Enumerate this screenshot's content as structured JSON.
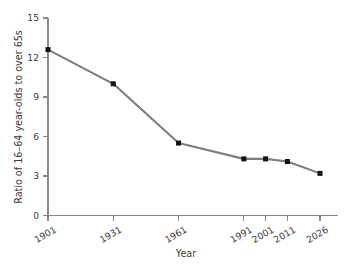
{
  "chart_data": {
    "type": "line",
    "title": "",
    "xlabel": "Year",
    "ylabel": "Ratio of 16–64 year-olds to over 65s",
    "categories": [
      "1901",
      "1931",
      "1961",
      "1991",
      "2001",
      "2011",
      "2026"
    ],
    "x": [
      1901,
      1931,
      1961,
      1991,
      2001,
      2011,
      2026
    ],
    "values": [
      12.6,
      10.0,
      5.5,
      4.3,
      4.3,
      4.1,
      3.2
    ],
    "series": [
      {
        "name": "Ratio of 16–64 year-olds to over 65s",
        "values": [
          12.6,
          10.0,
          5.5,
          4.3,
          4.3,
          4.1,
          3.2
        ]
      }
    ],
    "xtick_labels": [
      "1901",
      "1931",
      "1961",
      "1991",
      "2001",
      "2011",
      "2026"
    ],
    "ytick_labels": [
      "0",
      "3",
      "6",
      "9",
      "12",
      "15"
    ],
    "yticks": [
      0,
      3,
      6,
      9,
      12,
      15
    ],
    "ylim": [
      0,
      15
    ],
    "grid": false,
    "legend": false,
    "legend_position": "none",
    "marker": "square",
    "line_color": "#7d7d7d",
    "marker_color": "#111111",
    "axis_color": "#8a8a8a",
    "background_color": "#ffffff",
    "xtick_label_rotation": -30
  }
}
